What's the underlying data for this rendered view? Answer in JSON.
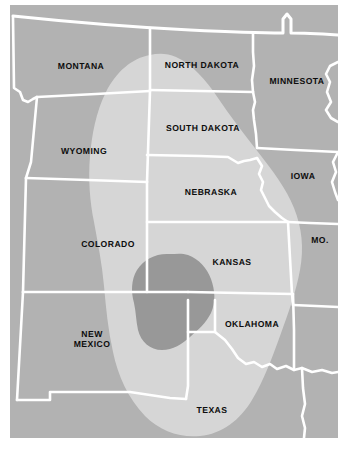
{
  "figure": {
    "type": "thematic-region-map",
    "width": 346,
    "height": 453,
    "caption_fragment": ""
  },
  "colors": {
    "page_background": "#ffffff",
    "base_land": "#b2b2b2",
    "overlay_light": "#d6d6d6",
    "overlay_core": "#989898",
    "border_line": "#ffffff",
    "label_text": "#0d0d0d"
  },
  "map": {
    "projection_note": "conic, north at top",
    "state_labels": [
      {
        "name": "MONTANA",
        "text": "MONTANA",
        "x": 81,
        "y": 66,
        "lines": 1
      },
      {
        "name": "NORTH DAKOTA",
        "text": "NORTH DAKOTA",
        "x": 202,
        "y": 65,
        "lines": 1
      },
      {
        "name": "MINNESOTA",
        "text": "MINNESOTA",
        "x": 297,
        "y": 81,
        "lines": 1
      },
      {
        "name": "SOUTH DAKOTA",
        "text": "SOUTH DAKOTA",
        "x": 203,
        "y": 128,
        "lines": 1
      },
      {
        "name": "WYOMING",
        "text": "WYOMING",
        "x": 84,
        "y": 151,
        "lines": 1
      },
      {
        "name": "IOWA",
        "text": "IOWA",
        "x": 303,
        "y": 176,
        "lines": 1
      },
      {
        "name": "NEBRASKA",
        "text": "NEBRASKA",
        "x": 211,
        "y": 192,
        "lines": 1
      },
      {
        "name": "COLORADO",
        "text": "COLORADO",
        "x": 108,
        "y": 244,
        "lines": 1
      },
      {
        "name": "MISSOURI",
        "text": "MO.",
        "x": 320,
        "y": 240,
        "lines": 1
      },
      {
        "name": "KANSAS",
        "text": "KANSAS",
        "x": 232,
        "y": 262,
        "lines": 1
      },
      {
        "name": "OKLAHOMA",
        "text": "OKLAHOMA",
        "x": 252,
        "y": 324,
        "lines": 1
      },
      {
        "name": "NEW MEXICO",
        "text": "NEW\nMEXICO",
        "x": 92,
        "y": 339,
        "lines": 2
      },
      {
        "name": "TEXAS",
        "text": "TEXAS",
        "x": 212,
        "y": 410,
        "lines": 1
      }
    ],
    "overlay_regions": [
      {
        "name": "affected-area-outer",
        "fill": "#d6d6d6",
        "extent_note": "elongated lobe running NNW from Montana/North Dakota border south through Wyoming, Colorado, Nebraska, Kansas, Oklahoma into central Texas"
      },
      {
        "name": "affected-area-core",
        "fill": "#989898",
        "extent_note": "compact blob centered over the SE Colorado / NE New Mexico / western Oklahoma panhandle junction"
      }
    ]
  }
}
